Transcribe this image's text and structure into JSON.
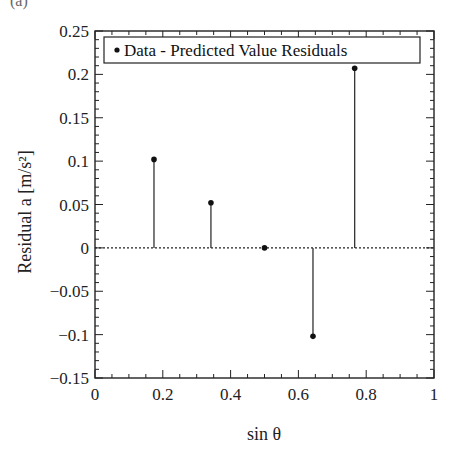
{
  "caption_fragment": "(a)",
  "chart_data": {
    "type": "scatter",
    "style": "stem",
    "title": "",
    "xlabel": "sin θ",
    "ylabel": "Residual a [m/s²]",
    "xlim": [
      0,
      1
    ],
    "ylim": [
      -0.15,
      0.25
    ],
    "xticks": [
      0,
      0.2,
      0.4,
      0.6,
      0.8,
      1
    ],
    "xtick_labels": [
      "0",
      "0.2",
      "0.4",
      "0.6",
      "0.8",
      "1"
    ],
    "yticks": [
      -0.15,
      -0.1,
      -0.05,
      0,
      0.05,
      0.1,
      0.15,
      0.2,
      0.25
    ],
    "ytick_labels": [
      "−0.15",
      "−0.1",
      "−0.05",
      "0",
      "0.05",
      "0.1",
      "0.15",
      "0.2",
      "0.25"
    ],
    "x_minor_step": 0.05,
    "y_minor_step": 0.01,
    "grid": false,
    "zero_line": {
      "y": 0,
      "style": "dotted"
    },
    "legend": {
      "position": "top",
      "entries": [
        "Data - Predicted Value Residuals"
      ]
    },
    "series": [
      {
        "name": "Data - Predicted Value Residuals",
        "marker": "dot",
        "x": [
          0.174,
          0.342,
          0.5,
          0.643,
          0.766
        ],
        "y": [
          0.102,
          0.052,
          0.0,
          -0.102,
          0.207
        ]
      }
    ]
  },
  "colors": {
    "axis": "#222222",
    "marker": "#111111",
    "stem": "#333333",
    "background": "#ffffff"
  }
}
